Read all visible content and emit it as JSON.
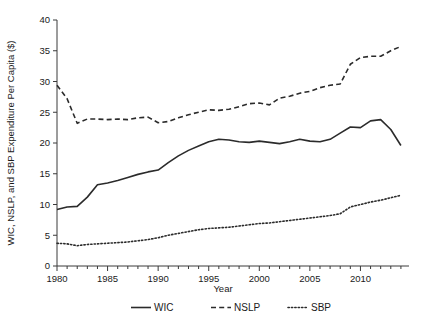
{
  "chart_data": {
    "type": "line",
    "title": "",
    "xlabel": "Year",
    "ylabel": "WIC, NSLP, and SBP Expenditure Per Capita ($)",
    "xlim": [
      1980,
      2014.8
    ],
    "ylim": [
      0,
      40
    ],
    "xticks": [
      1980,
      1985,
      1990,
      1995,
      2000,
      2005,
      2010
    ],
    "xtick_labels": [
      "1980",
      "1985",
      "1990",
      "1995",
      "2000",
      "2005",
      "2010"
    ],
    "yticks": [
      0,
      5,
      10,
      15,
      20,
      25,
      30,
      35,
      40
    ],
    "ytick_labels": [
      "0",
      "5",
      "10",
      "15",
      "20",
      "25",
      "30",
      "35",
      "40"
    ],
    "minor_xticks_every": 1,
    "grid": false,
    "legend_position": "below",
    "x": [
      1980,
      1981,
      1982,
      1983,
      1984,
      1985,
      1986,
      1987,
      1988,
      1989,
      1990,
      1991,
      1992,
      1993,
      1994,
      1995,
      1996,
      1997,
      1998,
      1999,
      2000,
      2001,
      2002,
      2003,
      2004,
      2005,
      2006,
      2007,
      2008,
      2009,
      2010,
      2011,
      2012,
      2013,
      2014
    ],
    "series": [
      {
        "name": "WIC",
        "style": "solid",
        "values": [
          9.2,
          9.6,
          9.7,
          11.2,
          13.2,
          13.5,
          13.9,
          14.4,
          14.9,
          15.3,
          15.6,
          16.8,
          17.9,
          18.8,
          19.5,
          20.2,
          20.6,
          20.5,
          20.2,
          20.1,
          20.3,
          20.1,
          19.9,
          20.2,
          20.6,
          20.3,
          20.2,
          20.6,
          21.6,
          22.6,
          22.5,
          23.6,
          23.8,
          22.2,
          19.6
        ]
      },
      {
        "name": "NSLP",
        "style": "dashed",
        "values": [
          29.4,
          27.2,
          23.2,
          23.9,
          23.9,
          23.8,
          23.9,
          23.8,
          24.1,
          24.2,
          23.3,
          23.5,
          24.1,
          24.6,
          25.0,
          25.4,
          25.3,
          25.5,
          25.9,
          26.4,
          26.5,
          26.2,
          27.3,
          27.6,
          28.1,
          28.4,
          29.0,
          29.4,
          29.6,
          32.8,
          33.9,
          34.1,
          34.1,
          35.0,
          35.7
        ]
      },
      {
        "name": "SBP",
        "style": "dotted",
        "values": [
          3.7,
          3.6,
          3.3,
          3.5,
          3.6,
          3.7,
          3.8,
          3.9,
          4.1,
          4.3,
          4.6,
          5.0,
          5.3,
          5.6,
          5.9,
          6.1,
          6.2,
          6.3,
          6.5,
          6.7,
          6.9,
          7.0,
          7.2,
          7.4,
          7.6,
          7.8,
          8.0,
          8.2,
          8.5,
          9.6,
          10.0,
          10.4,
          10.7,
          11.1,
          11.5
        ]
      }
    ],
    "legend": [
      {
        "label": "WIC",
        "style": "solid"
      },
      {
        "label": "NSLP",
        "style": "dashed"
      },
      {
        "label": "SBP",
        "style": "dotted"
      }
    ],
    "colors": {
      "line": "#2b2b2b",
      "axis": "#3a3a3a",
      "text": "#1a1a1a"
    }
  }
}
